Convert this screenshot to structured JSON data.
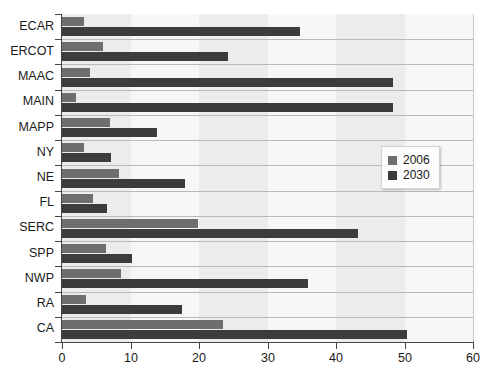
{
  "chart_data": {
    "type": "bar",
    "orientation": "horizontal",
    "title": "",
    "xlabel": "",
    "ylabel": "",
    "xlim": [
      0,
      60
    ],
    "xticks": [
      0,
      10,
      20,
      30,
      40,
      50,
      60
    ],
    "grid": false,
    "legend_position": "middle-right",
    "categories": [
      "ECAR",
      "ERCOT",
      "MAAC",
      "MAIN",
      "MAPP",
      "NY",
      "NE",
      "FL",
      "SERC",
      "SPP",
      "NWP",
      "RA",
      "CA"
    ],
    "series": [
      {
        "name": "2006",
        "color": "#6e6e6e",
        "values": [
          3.2,
          6.0,
          4.1,
          2.0,
          7.0,
          3.2,
          8.3,
          4.5,
          19.9,
          6.4,
          8.6,
          3.5,
          23.5
        ]
      },
      {
        "name": "2030",
        "color": "#3c3c3c",
        "values": [
          34.7,
          24.3,
          48.3,
          48.3,
          13.9,
          7.2,
          18.0,
          6.5,
          43.2,
          10.2,
          35.9,
          17.5,
          50.4
        ]
      }
    ]
  },
  "legend": {
    "entries": [
      {
        "label": "2006",
        "color": "#6e6e6e"
      },
      {
        "label": "2030",
        "color": "#3c3c3c"
      }
    ]
  }
}
